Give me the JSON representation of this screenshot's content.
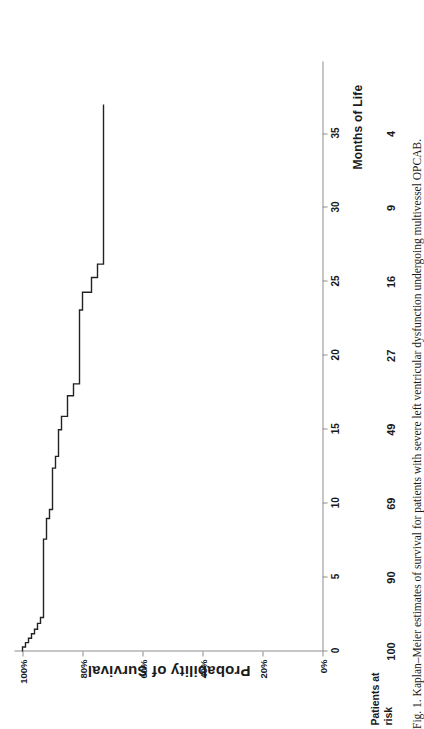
{
  "figure": {
    "caption": "Fig. 1. Kaplan–Meier estimates of survival for patients with severe left ventricular dysfunction undergoing multivessel OPCAB."
  },
  "axes": {
    "x_title": "Months of Life",
    "y_title": "Probability of Survival",
    "x_ticks": [
      "0",
      "5",
      "10",
      "15",
      "20",
      "25",
      "30",
      "35"
    ],
    "y_ticks": [
      "100%",
      "80%",
      "60%",
      "40%",
      "20%",
      "0%"
    ]
  },
  "risk_table": {
    "title_line1": "Patients at",
    "title_line2": "risk",
    "values": [
      "100",
      "90",
      "69",
      "49",
      "27",
      "16",
      "9",
      "4"
    ]
  },
  "colors": {
    "curve": "#222222",
    "axis": "#8d8d8d",
    "background": "#ffffff",
    "text": "#1a1a1a"
  },
  "chart_data": {
    "type": "line",
    "title": "Kaplan–Meier estimates of survival",
    "xlabel": "Months of Life",
    "ylabel": "Probability of Survival",
    "xlim": [
      0,
      39.5
    ],
    "ylim": [
      0,
      100
    ],
    "xticks": [
      0,
      5,
      10,
      15,
      20,
      25,
      30,
      35
    ],
    "yticks": [
      0,
      20,
      40,
      60,
      80,
      100
    ],
    "grid": false,
    "legend": null,
    "step_style": "post",
    "series": [
      {
        "name": "Survival",
        "x": [
          0,
          0.3,
          0.6,
          0.9,
          1.2,
          1.5,
          1.9,
          2.3,
          7.6,
          9.0,
          9.6,
          12.4,
          13.2,
          15.0,
          15.9,
          17.3,
          18.1,
          23.1,
          24.3,
          25.3,
          26.2,
          37.0
        ],
        "y": [
          100,
          99,
          98,
          97,
          96,
          95,
          94,
          93,
          92,
          91,
          90,
          89,
          88,
          87,
          85,
          83,
          81,
          80,
          77,
          75,
          73,
          73
        ],
        "values_note": "survival probability in percent at each step-down"
      }
    ],
    "patients_at_risk": {
      "x": [
        0,
        5,
        10,
        15,
        20,
        25,
        30,
        35
      ],
      "n": [
        100,
        90,
        69,
        49,
        27,
        16,
        9,
        4
      ]
    }
  }
}
